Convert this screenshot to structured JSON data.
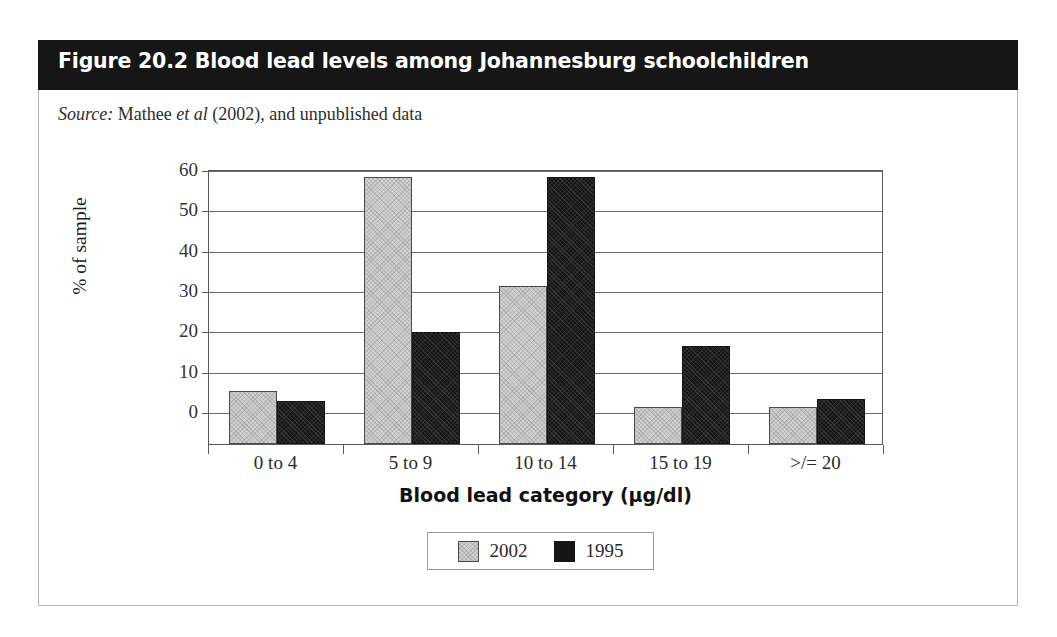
{
  "figure": {
    "title": "Figure 20.2 Blood lead levels among Johannesburg schoolchildren",
    "source_prefix": "Source:",
    "source_mid": " Mathee ",
    "source_italic2": "et al",
    "source_rest": " (2002), and unpublished data",
    "title_bar_color": "#161616",
    "card_border_color": "#b9b9b9"
  },
  "chart_data": {
    "type": "bar",
    "title": "Figure 20.2 Blood lead levels among Johannesburg schoolchildren",
    "subtitle": "Source: Mathee et al (2002), and unpublished data",
    "categories": [
      "0 to 4",
      "5 to 9",
      "10 to 14",
      "15 to 19",
      ">/= 20"
    ],
    "series": [
      {
        "name": "2002",
        "color": "#d2d2d2",
        "values": [
          5,
          58,
          31,
          1,
          1
        ]
      },
      {
        "name": "1995",
        "color": "#151515",
        "values": [
          2.5,
          19.5,
          58,
          16,
          3
        ]
      }
    ],
    "xlabel": "Blood lead category (µg/dl)",
    "ylabel": "% of sample",
    "ylim": [
      0,
      60
    ],
    "yticks": [
      0,
      10,
      20,
      30,
      40,
      50,
      60
    ],
    "ytick_labels": [
      "0",
      "10",
      "20",
      "30",
      "40",
      "50",
      "60"
    ],
    "grid": true,
    "legend_position": "bottom",
    "legend_entries": [
      "2002",
      "1995"
    ]
  }
}
